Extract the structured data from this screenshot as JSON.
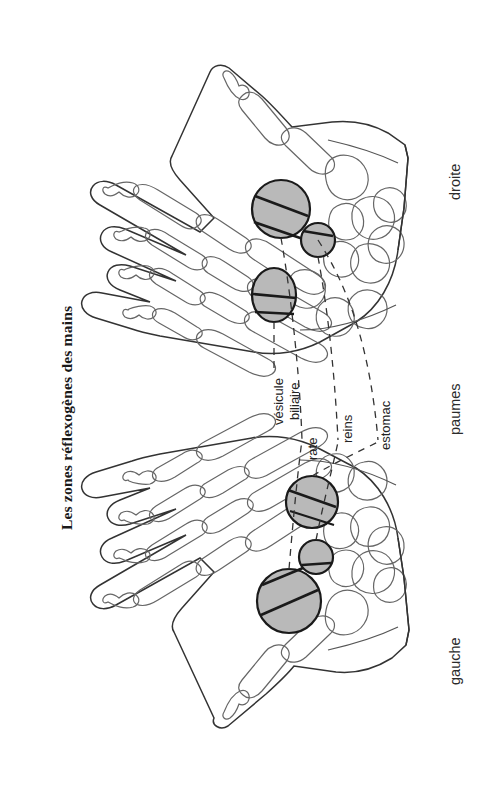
{
  "figure": {
    "title": "Les zones réflexogènes des mains",
    "view_label": "paumes",
    "hands": [
      {
        "id": "right-hand",
        "label": "droite",
        "position": "top"
      },
      {
        "id": "left-hand",
        "label": "gauche",
        "position": "bottom"
      }
    ],
    "organ_labels": [
      {
        "id": "vesicule-biliaire",
        "line1": "vésicule",
        "line2": "biliaire"
      },
      {
        "id": "rate",
        "line1": "rate",
        "line2": ""
      },
      {
        "id": "reins",
        "line1": "reins",
        "line2": ""
      },
      {
        "id": "estomac",
        "line1": "estomac",
        "line2": ""
      }
    ],
    "zones": [
      {
        "id": "zone-vesicule-biliaire",
        "organ": "vésicule biliaire",
        "hand": "droite",
        "shape": "ellipse"
      },
      {
        "id": "zone-rate-right",
        "organ": "rate",
        "hand": "droite",
        "shape": "circle"
      },
      {
        "id": "zone-reins-right",
        "organ": "reins",
        "hand": "droite",
        "shape": "circle-small"
      },
      {
        "id": "zone-estomac-left",
        "organ": "estomac",
        "hand": "gauche",
        "shape": "circle"
      },
      {
        "id": "zone-reins-left",
        "organ": "reins",
        "hand": "gauche",
        "shape": "circle-small"
      },
      {
        "id": "zone-rate-left",
        "organ": "rate",
        "hand": "gauche",
        "shape": "circle"
      }
    ],
    "colors": {
      "zone_fill": "#b9b9b9",
      "outline": "#2a2a2a",
      "bone_outline": "#555555",
      "background": "#ffffff",
      "text": "#1a1a1a"
    }
  }
}
